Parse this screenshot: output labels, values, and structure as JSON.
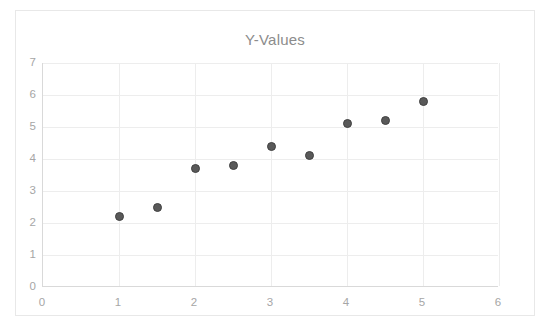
{
  "chart_data": {
    "type": "scatter",
    "title": "Y-Values",
    "xlabel": "",
    "ylabel": "",
    "x": [
      1,
      1.5,
      2,
      2.5,
      3,
      3.5,
      4,
      4.5,
      5
    ],
    "values": [
      2.2,
      2.5,
      3.7,
      3.8,
      4.4,
      4.1,
      5.1,
      5.2,
      5.8
    ],
    "series": [
      {
        "name": "Y-Values",
        "points": [
          {
            "x": 1,
            "y": 2.2
          },
          {
            "x": 1.5,
            "y": 2.5
          },
          {
            "x": 2,
            "y": 3.7
          },
          {
            "x": 2.5,
            "y": 3.8
          },
          {
            "x": 3,
            "y": 4.4
          },
          {
            "x": 3.5,
            "y": 4.1
          },
          {
            "x": 4,
            "y": 5.1
          },
          {
            "x": 4.5,
            "y": 5.2
          },
          {
            "x": 5,
            "y": 5.8
          }
        ]
      }
    ],
    "xlim": [
      0,
      6
    ],
    "ylim": [
      0,
      7
    ],
    "xticks": [
      "0",
      "1",
      "2",
      "3",
      "4",
      "5",
      "6"
    ],
    "xtick_values": [
      0,
      1,
      2,
      3,
      4,
      5,
      6
    ],
    "yticks": [
      "0",
      "1",
      "2",
      "3",
      "4",
      "5",
      "6",
      "7"
    ],
    "ytick_values": [
      0,
      1,
      2,
      3,
      4,
      5,
      6,
      7
    ],
    "grid": true,
    "grid_axis": "both",
    "legend": false,
    "marker_color": "#595959",
    "marker_edge_color": "#404040",
    "grid_color": "#ededed",
    "axis_color": "#d9d9d9",
    "title_color": "#8c8c8c",
    "tick_label_color": "#a6a6a6",
    "border_color": "#e8e8e8",
    "background_color": "#ffffff"
  }
}
